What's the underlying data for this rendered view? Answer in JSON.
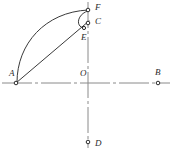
{
  "figure": {
    "background_color": "#ffffff",
    "line_color": "#3a3a3a",
    "axis_color": "#8a8a8a",
    "label_color": "#2b2b2b",
    "width": 171,
    "height": 154
  },
  "points": [
    {
      "id": "A",
      "label": "A",
      "x": 16,
      "y": 83,
      "label_x": 9,
      "label_y": 74
    },
    {
      "id": "B",
      "label": "B",
      "x": 158,
      "y": 83,
      "label_x": 155,
      "label_y": 73
    },
    {
      "id": "O",
      "label": "O",
      "x": 88,
      "y": 83,
      "label_x": 80,
      "label_y": 74
    },
    {
      "id": "C",
      "label": "C",
      "x": 88,
      "y": 23,
      "label_x": 95,
      "label_y": 22
    },
    {
      "id": "D",
      "label": "D",
      "x": 88,
      "y": 142,
      "label_x": 95,
      "label_y": 144
    },
    {
      "id": "E",
      "label": "E",
      "x": 84,
      "y": 28,
      "label_x": 81,
      "label_y": 38
    },
    {
      "id": "F",
      "label": "F",
      "x": 88,
      "y": 10,
      "label_x": 95,
      "label_y": 8
    }
  ],
  "axes": {
    "horizontal": {
      "name": "horizontal-axis",
      "x1": 2,
      "y1": 83,
      "x2": 170,
      "y2": 83,
      "style": "dash-dot"
    },
    "vertical": {
      "name": "vertical-axis",
      "x1": 88,
      "y1": 2,
      "x2": 88,
      "y2": 148,
      "style": "dash-dot"
    }
  },
  "segments": [
    {
      "name": "segment-A-C",
      "from": "A",
      "to": "C",
      "d": "M 16 83 L 89 21"
    }
  ],
  "arcs": [
    {
      "name": "major-arc-A-F",
      "from": "A",
      "to": "F",
      "d": "M 17 82 C 17 44 45 12 88 10"
    },
    {
      "name": "minor-arc-F-E",
      "from": "F",
      "to": "E",
      "d": "M 88 11 C 77 14 75 27 84 28"
    }
  ]
}
